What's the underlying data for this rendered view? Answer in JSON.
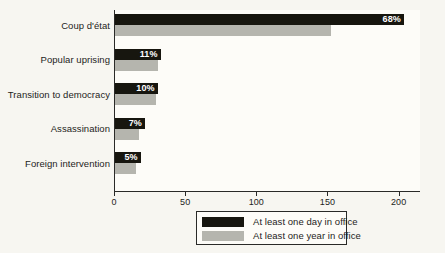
{
  "chart_data": {
    "type": "bar",
    "orientation": "horizontal",
    "title": "",
    "subtitle": "",
    "xlabel": "",
    "ylabel": "",
    "xlim": [
      0,
      208
    ],
    "xticks": [
      0,
      50,
      100,
      150,
      200
    ],
    "xtick_labels": [
      "0",
      "50",
      "100",
      "150",
      "200"
    ],
    "grid": false,
    "legend_position": "bottom-center",
    "categories": [
      "Coup d'état",
      "Popular uprising",
      "Transition to democracy",
      "Assassination",
      "Foreign intervention"
    ],
    "series": [
      {
        "name": "At least one day in office",
        "color": "#17160f",
        "values": [
          203,
          32,
          30,
          21,
          18
        ],
        "data_labels": [
          "68%",
          "11%",
          "10%",
          "7%",
          "5%"
        ]
      },
      {
        "name": "At least one year in office",
        "color": "#b5b5ae",
        "values": [
          152,
          30,
          29,
          17,
          15
        ],
        "data_labels": [
          "",
          "",
          "",
          "",
          ""
        ]
      }
    ]
  },
  "legend": {
    "items": [
      {
        "label": "At least one day in office",
        "color": "#17160f"
      },
      {
        "label": "At least one year in office",
        "color": "#b5b5ae"
      }
    ]
  },
  "colors": {
    "background": "#f7f6f1",
    "plot_background": "#fdfcf8",
    "axis": "#2a2a28",
    "text": "#1d1d1b",
    "series_day": "#17160f",
    "series_year": "#b5b5ae",
    "value_label": "#ffffff"
  }
}
